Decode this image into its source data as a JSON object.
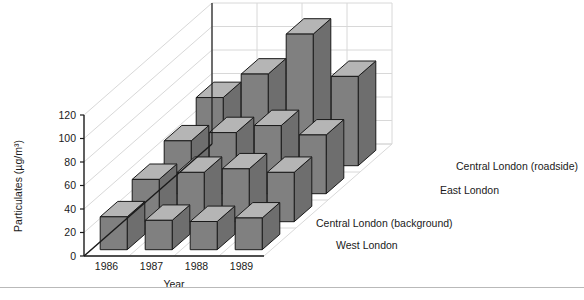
{
  "chart_data": {
    "type": "bar",
    "render": "3d-grouped-bar",
    "title": "",
    "xlabel": "Year",
    "ylabel": "Particulates (µg/m³)",
    "categories": [
      "1986",
      "1987",
      "1988",
      "1989"
    ],
    "ylim": [
      0,
      120
    ],
    "yticks": [
      0,
      20,
      40,
      60,
      80,
      100,
      120
    ],
    "ytick_labels": [
      "0",
      "20",
      "40",
      "60",
      "80",
      "100",
      "120"
    ],
    "grid": true,
    "legend_position": "right-depth-axis",
    "series": [
      {
        "name": "West London",
        "values": [
          28,
          25,
          24,
          27
        ]
      },
      {
        "name": "Central London (background)",
        "values": [
          36,
          42,
          45,
          42
        ]
      },
      {
        "name": "East London",
        "values": [
          45,
          52,
          58,
          50
        ]
      },
      {
        "name": "Central London (roadside)",
        "values": [
          58,
          78,
          112,
          76
        ]
      }
    ],
    "colors": {
      "bar_front": "#808080",
      "bar_top": "#b5b5b5",
      "bar_side": "#6e6e6e",
      "bar_edge": "#1a1a1a",
      "grid": "#d8d8d8",
      "axis": "#1a1a1a",
      "background": "#ffffff",
      "rule": "#b9b9b9"
    }
  }
}
